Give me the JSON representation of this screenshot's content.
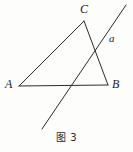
{
  "figure": {
    "caption": "图 3",
    "background_color": "#fdfdfb",
    "stroke_color": "#2b2b2b",
    "stroke_width": 1,
    "width": 133,
    "height": 152
  },
  "labels": {
    "vertex_a": "A",
    "vertex_b": "B",
    "vertex_c": "C",
    "line_a": "a"
  },
  "geometry": {
    "type": "plane-geometry-diagram",
    "description": "Triangle ABC crossed by a straight line a",
    "points": {
      "A": {
        "x": 19,
        "y": 86
      },
      "B": {
        "x": 108,
        "y": 85
      },
      "C": {
        "x": 84,
        "y": 21
      }
    },
    "segments": [
      {
        "name": "AC",
        "from": "A",
        "to": "C"
      },
      {
        "name": "CB",
        "from": "C",
        "to": "B"
      },
      {
        "name": "AB",
        "from": "A",
        "to": "B"
      }
    ],
    "line": {
      "name": "a",
      "start": {
        "x": 42,
        "y": 129
      },
      "end": {
        "x": 126,
        "y": 5
      }
    },
    "intersections": [
      {
        "with": "AB",
        "x": 70,
        "y": 85
      },
      {
        "with": "CB",
        "x": 98,
        "y": 53
      }
    ]
  }
}
